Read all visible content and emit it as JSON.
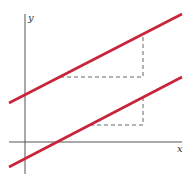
{
  "diagram": {
    "axes": {
      "x_label": "x",
      "y_label": "y"
    },
    "colors": {
      "line": "#c8243a",
      "axis": "#555555",
      "dash": "#666666"
    },
    "lines": [
      {
        "name": "upper-line",
        "x1": 9,
        "y1": 103,
        "x2": 182,
        "y2": 14
      },
      {
        "name": "lower-line",
        "x1": 9,
        "y1": 167,
        "x2": 182,
        "y2": 77
      }
    ],
    "slope_triangles": [
      {
        "name": "upper-slope-triangle",
        "run_start_x": 60,
        "run_y": 77,
        "corner_x": 143,
        "rise_top_y": 33
      },
      {
        "name": "lower-slope-triangle",
        "run_start_x": 90,
        "run_y": 125,
        "corner_x": 143,
        "rise_top_y": 97
      }
    ]
  }
}
